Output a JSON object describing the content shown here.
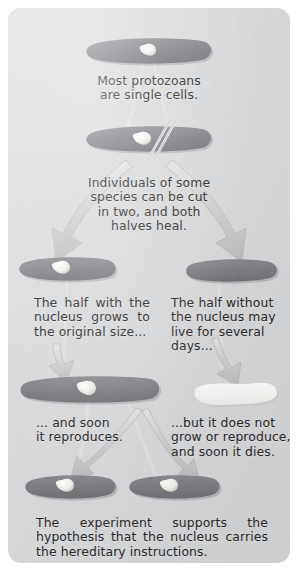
{
  "figure": {
    "panel_bg": "#d9dadb",
    "cell_color": "#7e8084",
    "nucleus_color": "#f6f5f2",
    "dead_cell_color": "#fbfbf9",
    "arrow_color": "#cfd0d1",
    "text_color": "#2a2a2c"
  },
  "captions": {
    "intro": "Most protozoans\nare single cells.",
    "cut": "Individuals of some\nspecies can be cut\nin two, and both\nhalves heal.",
    "half_with_nucleus": "The half with the nucleus grows to the original size...",
    "half_without_nucleus": "The half without the nucleus may live for several days...",
    "reproduces": "... and soon\nit reproduces.",
    "dies": "...but it does not grow or reproduce, and soon it dies.",
    "conclusion": "The experiment supports the hypothesis that the nucleus carries the hereditary instructions."
  },
  "cells": [
    {
      "name": "whole-protozoan",
      "has_nucleus": true,
      "state": "alive",
      "label": "whole protozoan cell"
    },
    {
      "name": "protozoan-being-cut",
      "has_nucleus": true,
      "state": "alive",
      "label": "protozoan with cut line"
    },
    {
      "name": "left-half-with-nucleus",
      "has_nucleus": true,
      "state": "alive",
      "label": "half cell containing nucleus"
    },
    {
      "name": "right-half-without-nucleus",
      "has_nucleus": false,
      "state": "alive",
      "label": "half cell without nucleus"
    },
    {
      "name": "regrown-cell",
      "has_nucleus": true,
      "state": "alive",
      "label": "cell regrown to original size"
    },
    {
      "name": "dying-cell",
      "has_nucleus": false,
      "state": "dying",
      "label": "pale cell that does not grow"
    },
    {
      "name": "daughter-cell-left",
      "has_nucleus": true,
      "state": "alive",
      "label": "daughter cell"
    },
    {
      "name": "daughter-cell-right",
      "has_nucleus": true,
      "state": "alive",
      "label": "daughter cell"
    }
  ],
  "arrows": [
    {
      "name": "arrow-split-left",
      "from": "protozoan-being-cut",
      "to": "left-half-with-nucleus"
    },
    {
      "name": "arrow-split-right",
      "from": "protozoan-being-cut",
      "to": "right-half-without-nucleus"
    },
    {
      "name": "arrow-regrow",
      "from": "left-half-with-nucleus",
      "to": "regrown-cell"
    },
    {
      "name": "arrow-decline",
      "from": "right-half-without-nucleus",
      "to": "dying-cell"
    },
    {
      "name": "arrow-divide-left",
      "from": "regrown-cell",
      "to": "daughter-cell-left"
    },
    {
      "name": "arrow-divide-right",
      "from": "regrown-cell",
      "to": "daughter-cell-right"
    }
  ]
}
